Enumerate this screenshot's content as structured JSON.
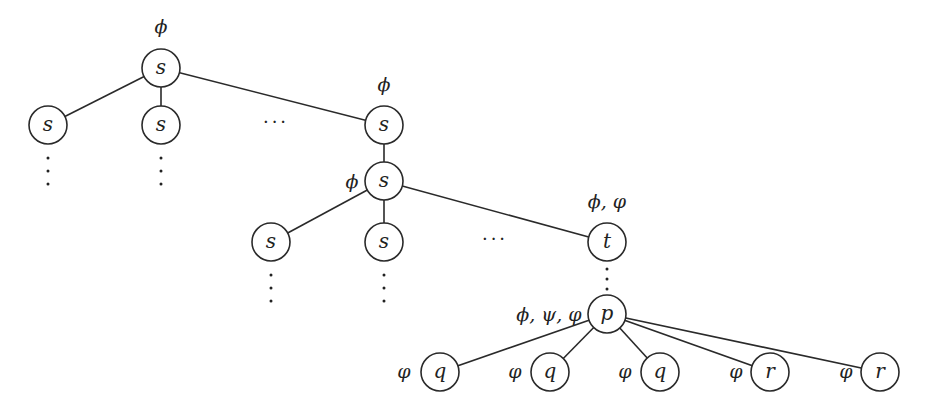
{
  "diagram": {
    "type": "tree",
    "node_radius": 19,
    "colors": {
      "stroke": "#2a2a2a",
      "text": "#222222",
      "background": "#ffffff"
    },
    "nodes": [
      {
        "id": "root",
        "label": "s",
        "x": 161,
        "y": 68,
        "annotation": "ϕ",
        "ax": 161,
        "ay": 33
      },
      {
        "id": "l2a",
        "label": "s",
        "x": 48,
        "y": 125,
        "vdots": true
      },
      {
        "id": "l2b",
        "label": "s",
        "x": 161,
        "y": 125,
        "vdots": true
      },
      {
        "id": "l2c",
        "label": "s",
        "x": 384,
        "y": 125,
        "annotation": "ϕ",
        "ax": 384,
        "ay": 91
      },
      {
        "id": "mid",
        "label": "s",
        "x": 384,
        "y": 181,
        "annotation": "ϕ",
        "ax": 352,
        "ay": 188
      },
      {
        "id": "l3a",
        "label": "s",
        "x": 271,
        "y": 242,
        "vdots": true
      },
      {
        "id": "l3b",
        "label": "s",
        "x": 384,
        "y": 242,
        "vdots": true
      },
      {
        "id": "t",
        "label": "t",
        "x": 607,
        "y": 242,
        "annotation": "ϕ, φ",
        "ax": 607,
        "ay": 208
      },
      {
        "id": "p",
        "label": "p",
        "x": 607,
        "y": 314,
        "annotation": "ϕ, ψ, φ",
        "ax": 549,
        "ay": 321
      },
      {
        "id": "q1",
        "label": "q",
        "x": 440,
        "y": 372,
        "annotation": "φ",
        "ax": 404,
        "ay": 378
      },
      {
        "id": "q2",
        "label": "q",
        "x": 550,
        "y": 372,
        "annotation": "φ",
        "ax": 515,
        "ay": 378
      },
      {
        "id": "q3",
        "label": "q",
        "x": 660,
        "y": 372,
        "annotation": "φ",
        "ax": 625,
        "ay": 378
      },
      {
        "id": "r1",
        "label": "r",
        "x": 770,
        "y": 372,
        "annotation": "φ",
        "ax": 736,
        "ay": 378
      },
      {
        "id": "r2",
        "label": "r",
        "x": 880,
        "y": 372,
        "annotation": "φ",
        "ax": 846,
        "ay": 378
      }
    ],
    "edges": [
      [
        "root",
        "l2a"
      ],
      [
        "root",
        "l2b"
      ],
      [
        "root",
        "l2c"
      ],
      [
        "l2c",
        "mid"
      ],
      [
        "mid",
        "l3a"
      ],
      [
        "mid",
        "l3b"
      ],
      [
        "mid",
        "t"
      ],
      [
        "p",
        "q1"
      ],
      [
        "p",
        "q2"
      ],
      [
        "p",
        "q3"
      ],
      [
        "p",
        "r1"
      ],
      [
        "p",
        "r2"
      ]
    ],
    "dotted_edges": [
      [
        "t",
        "p"
      ]
    ],
    "ellipses": [
      {
        "text": "···",
        "x": 276,
        "y": 128
      },
      {
        "text": "···",
        "x": 495,
        "y": 245
      }
    ]
  }
}
